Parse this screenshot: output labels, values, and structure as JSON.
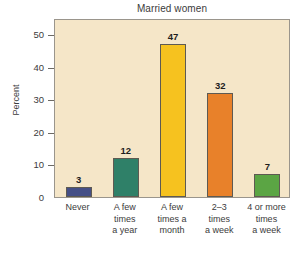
{
  "chart_data": {
    "type": "bar",
    "title": "Married women",
    "xlabel": "",
    "ylabel": "Percent",
    "categories": [
      "Never",
      "A few\ntimes\na year",
      "A few\ntimes a\nmonth",
      "2–3\ntimes\na week",
      "4 or more\ntimes\na week"
    ],
    "values": [
      3,
      12,
      47,
      32,
      7
    ],
    "value_labels": [
      "3",
      "12",
      "47",
      "32",
      "7"
    ],
    "ylim": [
      0,
      55
    ],
    "yticks": [
      0,
      10,
      20,
      30,
      40,
      50
    ],
    "ytick_labels": [
      "0",
      "10",
      "20",
      "30",
      "40",
      "50"
    ],
    "grid": false,
    "legend": false,
    "bar_colors": [
      "#454f86",
      "#2f8068",
      "#f6c21f",
      "#e8812a",
      "#5ba544"
    ],
    "plot_background": "#f5e6c8",
    "plot_border": "#9a958c",
    "text_color": "#3b3b3b"
  }
}
